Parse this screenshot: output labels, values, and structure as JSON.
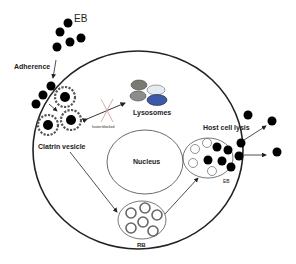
{
  "labels": {
    "eb_top": "EB",
    "adherence": "Adherence",
    "fusion_blocked": "fusion blocked",
    "lysosomes": "Lysosomes",
    "clatrin_vesicle": "Clatrin vesicle",
    "nucleus": "Nucleus",
    "host_cell_lysis": "Host cell lysis",
    "eb_inclusion": "EB",
    "rb": "RB"
  },
  "colors": {
    "line": "#222222",
    "eb_dot": "#000000",
    "lysosome_1": "#7a7a72",
    "lysosome_2": "#e4ecf2",
    "lysosome_3": "#8c8c8c",
    "lysosome_4": "#3c5aa8",
    "fusion_cross": "#d9a0a0"
  }
}
